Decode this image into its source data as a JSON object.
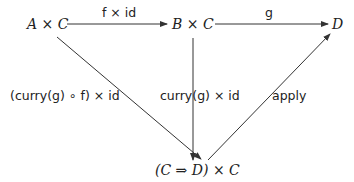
{
  "diagram": {
    "type": "commutative-diagram",
    "objects": {
      "AxC": "A × C",
      "BxC": "B × C",
      "D": "D",
      "CtoDxC": "(C ⇒ D) × C"
    },
    "morphisms": [
      {
        "id": "f_x_id",
        "from": "A × C",
        "to": "B × C",
        "label": "f × id"
      },
      {
        "id": "g",
        "from": "B × C",
        "to": "D",
        "label": "g"
      },
      {
        "id": "curry_g_of_x_id",
        "from": "A × C",
        "to": "(C ⇒ D) × C",
        "label": "(curry(g) ∘ f) × id"
      },
      {
        "id": "curry_g_x_id",
        "from": "B × C",
        "to": "(C ⇒ D) × C",
        "label": "curry(g) × id"
      },
      {
        "id": "apply",
        "from": "(C ⇒ D) × C",
        "to": "D",
        "label": "apply"
      }
    ]
  }
}
